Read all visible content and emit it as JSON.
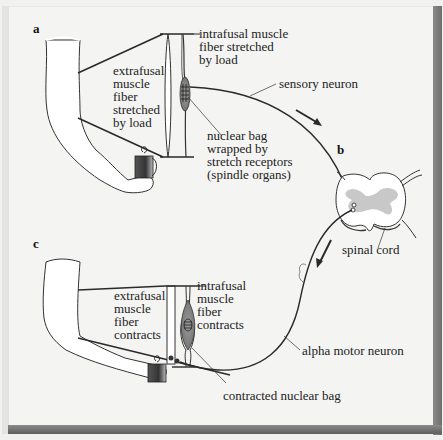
{
  "figure": {
    "panels": {
      "a": {
        "letter": "a",
        "extrafusal_label": [
          "extrafusal",
          "muscle",
          "fiber",
          "stretched",
          "by load"
        ],
        "intrafusal_label": [
          "intrafusal muscle",
          "fiber stretched",
          "by load"
        ],
        "nuclear_bag_label": [
          "nuclear bag",
          "wrapped by",
          "stretch receptors",
          "(spindle organs)"
        ],
        "sensory_neuron_label": "sensory neuron"
      },
      "b": {
        "letter": "b",
        "spinal_cord_label": "spinal cord"
      },
      "c": {
        "letter": "c",
        "extrafusal_label": [
          "extrafusal",
          "muscle",
          "fiber",
          "contracts"
        ],
        "intrafusal_label": [
          "intrafusal",
          "muscle",
          "fiber",
          "contracts"
        ],
        "contracted_bag_label": "contracted nuclear bag",
        "alpha_motor_neuron_label": "alpha motor neuron"
      }
    },
    "colors": {
      "background": "#f4f4f3",
      "line": "#2a2a2a",
      "arm_fill": "#ffffff",
      "gray_matter": "#c8c8c8",
      "nuclear_bag": "#8c8c8c",
      "bevel": "#737373"
    }
  }
}
